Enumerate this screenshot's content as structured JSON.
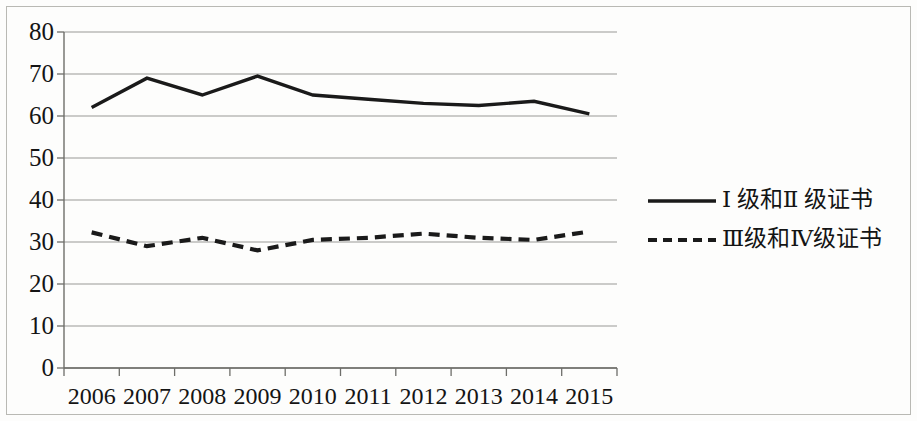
{
  "chart_data": {
    "type": "line",
    "title": "",
    "xlabel": "",
    "ylabel": "",
    "categories": [
      "2006",
      "2007",
      "2008",
      "2009",
      "2010",
      "2011",
      "2012",
      "2013",
      "2014",
      "2015"
    ],
    "ylim": [
      0,
      80
    ],
    "ytick_values": [
      0,
      10,
      20,
      30,
      40,
      50,
      60,
      70,
      80
    ],
    "ytick_labels": [
      "0",
      "10",
      "20",
      "30",
      "40",
      "50",
      "60",
      "70",
      "80"
    ],
    "grid": true,
    "grid_axis": "y",
    "legend_position": "right",
    "series": [
      {
        "name": "Ⅰ 级和Ⅱ 级证书",
        "style": "solid",
        "color": "#1a1a1a",
        "values": [
          62,
          69,
          65,
          69.5,
          65,
          64,
          63,
          62.5,
          63.5,
          60.5
        ]
      },
      {
        "name": "Ⅲ级和Ⅳ级证书",
        "style": "dashed",
        "color": "#1a1a1a",
        "values": [
          32.3,
          29,
          31,
          28,
          30.5,
          31,
          32,
          31,
          30.5,
          32.5
        ]
      }
    ]
  },
  "axis": {
    "y_labels": [
      "80",
      "70",
      "60",
      "50",
      "40",
      "30",
      "20",
      "10",
      "0"
    ],
    "x_labels": [
      "2006",
      "2007",
      "2008",
      "2009",
      "2010",
      "2011",
      "2012",
      "2013",
      "2014",
      "2015"
    ]
  },
  "legend": {
    "entries": [
      {
        "label": "Ⅰ 级和Ⅱ 级证书",
        "style": "solid"
      },
      {
        "label": "Ⅲ级和Ⅳ级证书",
        "style": "dashed"
      }
    ]
  },
  "colors": {
    "line": "#1a1a1a",
    "grid": "#9a9a95",
    "axis": "#6e6e6a",
    "frame": "#b9b9b4",
    "background": "#fdfdfc",
    "text": "#141414"
  }
}
